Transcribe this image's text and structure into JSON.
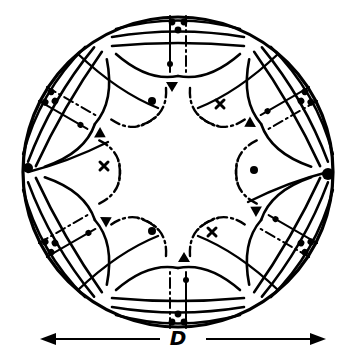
{
  "diagram": {
    "symmetry": 6,
    "markers": {
      "dots": 3,
      "crosses": 3
    },
    "dimension": {
      "label": "D",
      "arrow": "double-headed, spans circle diameter"
    },
    "colors": {
      "ink": "#000000",
      "background": "#ffffff"
    }
  }
}
